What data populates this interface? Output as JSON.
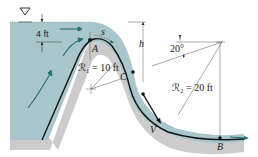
{
  "diagram": {
    "type": "fluid-flow-over-spillway",
    "colors": {
      "water": "#a9c6cc",
      "water_light": "#c3d9dd",
      "ground": "#c8c8c8",
      "arrow": "#1f6f70",
      "line": "#111111",
      "dim_line": "#555555"
    },
    "labels": {
      "depth": "4 ft",
      "point_a": "A",
      "point_b": "B",
      "point_c": "C",
      "height": "h",
      "arc_s": "s",
      "radius_1": "ℛ₁ = 10 ft",
      "radius_2": "ℛ₂ = 20 ft",
      "angle": "20°",
      "velocity": "V"
    },
    "symbols": {
      "free_surface": "free-surface-triangle"
    }
  }
}
